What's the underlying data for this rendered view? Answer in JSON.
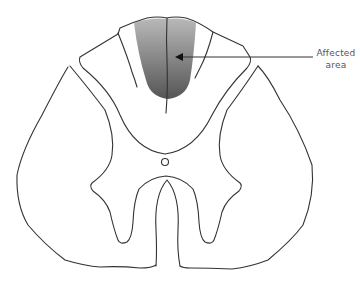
{
  "diagram": {
    "shaded_region": "dorsal columns",
    "label": {
      "line1": "Affected",
      "line2": "area"
    },
    "colors": {
      "outline": "#333333",
      "shade_light": "#b4b4b4",
      "shade_dark": "#5a5a5a",
      "label_text": "#555555",
      "background": "#ffffff"
    }
  }
}
